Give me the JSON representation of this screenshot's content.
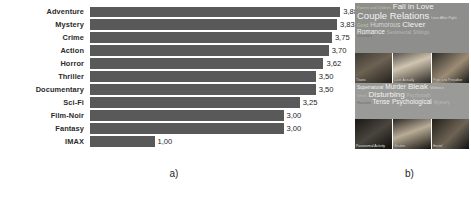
{
  "figure": {
    "caption_a": "a)",
    "caption_b": "b)"
  },
  "chart_data": {
    "type": "bar",
    "orientation": "horizontal",
    "title": "",
    "xlabel": "",
    "ylabel": "",
    "xlim": [
      0,
      4
    ],
    "grid": false,
    "legend": false,
    "decimal_separator": ",",
    "categories": [
      "Adventure",
      "Mystery",
      "Crime",
      "Action",
      "Horror",
      "Thriller",
      "Documentary",
      "Sci-Fi",
      "Film-Noir",
      "Fantasy",
      "IMAX"
    ],
    "values": [
      3.88,
      3.83,
      3.75,
      3.7,
      3.62,
      3.5,
      3.5,
      3.25,
      3.0,
      3.0,
      1.0
    ],
    "labels": [
      "3,88",
      "3,83",
      "3,75",
      "3,70",
      "3,62",
      "3,50",
      "3,50",
      "3,25",
      "3,00",
      "3,00",
      "1,00"
    ],
    "bar_color": "#595959"
  },
  "wordclouds": [
    {
      "name": "romance-cloud",
      "background": "#8e8f8c",
      "lines": [
        [
          {
            "text": "Parents and Children",
            "size": "xs",
            "color": "green"
          },
          {
            "text": "Fall in Love",
            "size": "lg",
            "color": "white"
          }
        ],
        [
          {
            "text": "Couple Relations",
            "size": "xl",
            "color": "white"
          },
          {
            "text": "Love After Fight",
            "size": "xs",
            "color": "light"
          }
        ],
        [
          {
            "text": "Good",
            "size": "sm",
            "color": "green"
          },
          {
            "text": "Humorous",
            "size": "md",
            "color": "light"
          },
          {
            "text": "Clever",
            "size": "lg",
            "color": "white"
          }
        ],
        [
          {
            "text": "Romance",
            "size": "md",
            "color": "white"
          },
          {
            "text": "Sentimental",
            "size": "sm",
            "color": "dim"
          },
          {
            "text": "Siblings",
            "size": "sm",
            "color": "dim"
          }
        ],
        [
          {
            "text": "Relations",
            "size": "xs",
            "color": "dark"
          }
        ]
      ]
    },
    {
      "name": "horror-cloud",
      "background": "#9a9b98",
      "lines": [
        [
          {
            "text": "Supernatural",
            "size": "sm",
            "color": "white"
          },
          {
            "text": "Murder",
            "size": "md",
            "color": "white"
          },
          {
            "text": "Bleak",
            "size": "lg",
            "color": "white"
          },
          {
            "text": "Violence",
            "size": "xs",
            "color": "light"
          }
        ],
        [
          {
            "text": "Ghost",
            "size": "xs",
            "color": "dim"
          },
          {
            "text": "Disturbing",
            "size": "lg",
            "color": "white"
          },
          {
            "text": "Psychopath",
            "size": "sm",
            "color": "dim"
          }
        ],
        [
          {
            "text": "Haunted",
            "size": "xs",
            "color": "dark"
          },
          {
            "text": "Tense",
            "size": "md",
            "color": "white"
          },
          {
            "text": "Psychological",
            "size": "md",
            "color": "white"
          },
          {
            "text": "Mystery",
            "size": "sm",
            "color": "dim"
          }
        ]
      ]
    }
  ],
  "thumbnail_strips": [
    {
      "name": "romance-thumbnails",
      "items": [
        {
          "caption": "Titanic"
        },
        {
          "caption": "Love Actually"
        },
        {
          "caption": "Pride and Prejudice"
        }
      ]
    },
    {
      "name": "horror-thumbnails",
      "items": [
        {
          "caption": "Paranormal Activity"
        },
        {
          "caption": "Shutter"
        },
        {
          "caption": "Hostel"
        }
      ]
    }
  ]
}
